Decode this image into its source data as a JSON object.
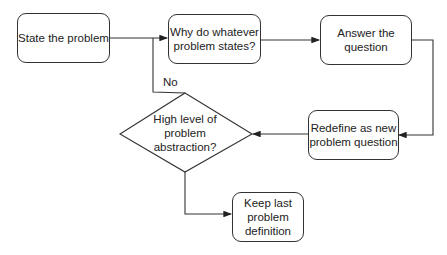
{
  "diagram": {
    "type": "flowchart",
    "nodes": [
      {
        "id": "state",
        "shape": "rounded-rect",
        "label": "State the problem"
      },
      {
        "id": "why",
        "shape": "rounded-rect",
        "label": "Why do whatever\nproblem states?"
      },
      {
        "id": "answer",
        "shape": "rounded-rect",
        "label": "Answer the\nquestion"
      },
      {
        "id": "redefine",
        "shape": "rounded-rect",
        "label": "Redefine as new\nproblem question"
      },
      {
        "id": "decision",
        "shape": "diamond",
        "label": "High level of\nproblem\nabstraction?"
      },
      {
        "id": "keep",
        "shape": "rounded-rect",
        "label": "Keep last\nproblem\ndefinition"
      }
    ],
    "edges": [
      {
        "from": "state",
        "to": "why",
        "label": ""
      },
      {
        "from": "why",
        "to": "answer",
        "label": ""
      },
      {
        "from": "answer",
        "to": "redefine",
        "label": ""
      },
      {
        "from": "redefine",
        "to": "decision",
        "label": ""
      },
      {
        "from": "decision",
        "to": "why",
        "label": "No"
      },
      {
        "from": "decision",
        "to": "keep",
        "label": ""
      }
    ],
    "edge_label_no": "No"
  }
}
